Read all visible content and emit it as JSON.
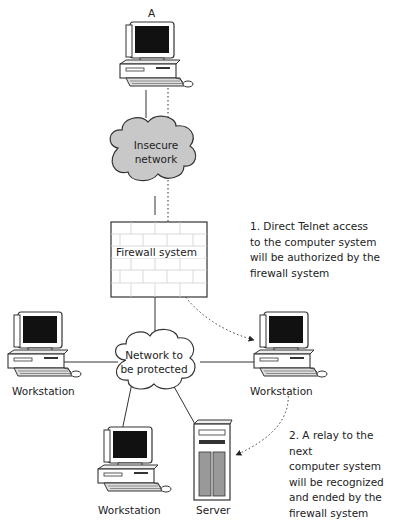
{
  "diagram": {
    "type": "network-firewall-diagram",
    "nodes": {
      "computer_a": {
        "label": "A"
      },
      "insecure_network": {
        "label_line1": "Insecure",
        "label_line2": "network"
      },
      "firewall": {
        "label": "Firewall system"
      },
      "protected_network": {
        "label_line1": "Network to",
        "label_line2": "be protected"
      },
      "workstation_left": {
        "label": "Workstation"
      },
      "workstation_right": {
        "label": "Workstation"
      },
      "workstation_bottom": {
        "label": "Workstation"
      },
      "server": {
        "label": "Server"
      }
    },
    "notes": {
      "note1": "1. Direct Telnet access\nto the computer system\nwill be authorized by the\nfirewall system",
      "note2": "2. A relay to the next\ncomputer system\nwill be recognized\nand ended by the\nfirewall system"
    },
    "colors": {
      "cloud_fill": "#c8c8c8",
      "outline": "#333333",
      "screen": "#111111",
      "firewall_bricks": "#d8d8d8"
    }
  }
}
